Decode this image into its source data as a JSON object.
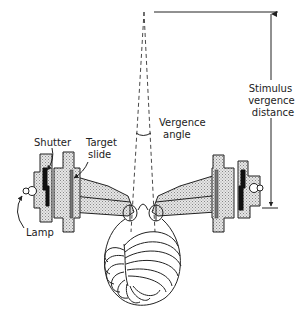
{
  "labels": {
    "stimulus_distance": [
      "Stimulus",
      "vergence",
      "distance"
    ],
    "vergence_angle": [
      "Vergence",
      "angle"
    ],
    "shutter": "Shutter",
    "target_slide": [
      "Target",
      "slide"
    ],
    "lamp": "Lamp"
  }
}
